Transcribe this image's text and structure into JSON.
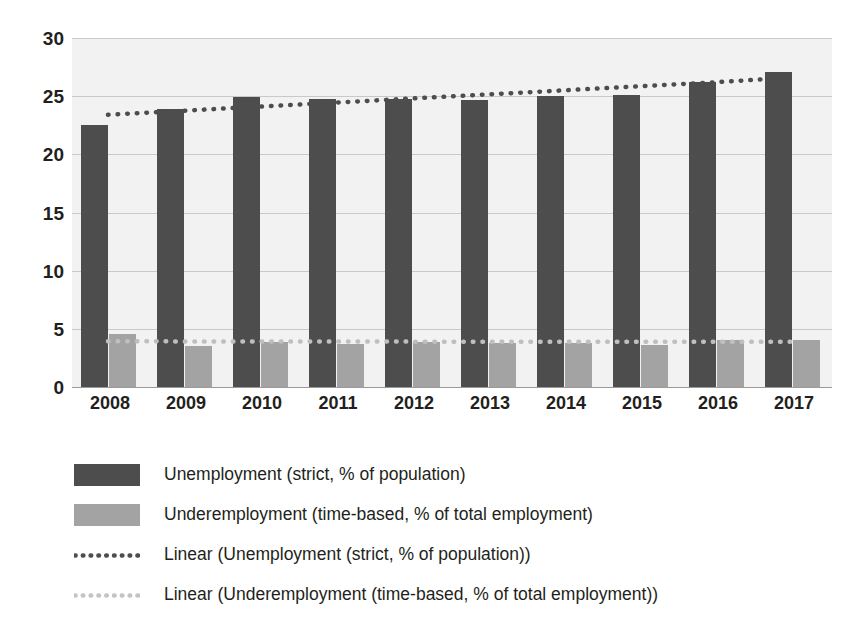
{
  "chart_data": {
    "type": "bar",
    "title": "",
    "subtitle": "",
    "xlabel": "",
    "ylabel": "",
    "categories": [
      "2008",
      "2009",
      "2010",
      "2011",
      "2012",
      "2013",
      "2014",
      "2015",
      "2016",
      "2017"
    ],
    "ylim": [
      0,
      30
    ],
    "yticks": [
      0,
      5,
      10,
      15,
      20,
      25,
      30
    ],
    "ytick_labels": [
      "0",
      "5",
      "10",
      "15",
      "20",
      "25",
      "30"
    ],
    "grid": true,
    "grid_axis": "y",
    "legend_position": "bottom-left",
    "series": [
      {
        "name": "Unemployment (strict, % of population)",
        "kind": "bar",
        "color": "#4d4d4d",
        "values": [
          22.5,
          23.9,
          24.9,
          24.8,
          24.8,
          24.7,
          25.0,
          25.1,
          26.2,
          27.1
        ]
      },
      {
        "name": "Underemployment (time-based, % of total employment)",
        "kind": "bar",
        "color": "#a3a3a3",
        "values": [
          4.6,
          3.5,
          3.9,
          3.7,
          3.9,
          3.8,
          3.8,
          3.6,
          4.0,
          4.0
        ]
      },
      {
        "name": "Linear (Unemployment (strict, % of population))",
        "kind": "trendline",
        "style": "dotted",
        "color": "#4d4d4d",
        "values": [
          23.4,
          23.75,
          24.1,
          24.45,
          24.8,
          25.15,
          25.5,
          25.85,
          26.2,
          26.6
        ]
      },
      {
        "name": "Linear (Underemployment (time-based, % of total employment))",
        "kind": "trendline",
        "style": "dotted",
        "color": "#bfbfbf",
        "values": [
          3.93,
          3.92,
          3.92,
          3.91,
          3.9,
          3.9,
          3.89,
          3.89,
          3.88,
          3.88
        ]
      }
    ]
  },
  "axes": {
    "y_tick_labels": [
      "30",
      "25",
      "20",
      "15",
      "10",
      "5",
      "0"
    ],
    "x_tick_labels": [
      "2008",
      "2009",
      "2010",
      "2011",
      "2012",
      "2013",
      "2014",
      "2015",
      "2016",
      "2017"
    ]
  },
  "legend": {
    "items": [
      {
        "label": "Unemployment (strict, % of population)",
        "key": "swatch",
        "color": "#4d4d4d"
      },
      {
        "label": "Underemployment (time-based, % of total employment)",
        "key": "swatch",
        "color": "#a3a3a3"
      },
      {
        "label": "Linear (Unemployment (strict, % of population))",
        "key": "dotted",
        "color": "#4d4d4d"
      },
      {
        "label": "Linear (Underemployment (time-based, % of total employment))",
        "key": "dotted",
        "color": "#c4c4c4"
      }
    ]
  },
  "colors": {
    "primary_bar": "#4d4d4d",
    "secondary_bar": "#a3a3a3",
    "plot_background": "#f2f2f2",
    "gridline": "#c9c9c9",
    "text": "#231f20"
  }
}
